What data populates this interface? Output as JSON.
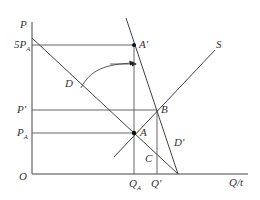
{
  "diagram": {
    "type": "supply-demand",
    "axes": {
      "y_label": "P",
      "x_label": "Q/t",
      "origin_label": "O"
    },
    "price_labels": {
      "five_pa": {
        "main": "5P",
        "sub": "A"
      },
      "p_prime": {
        "main": "P'"
      },
      "p_a": {
        "main": "P",
        "sub": "A"
      }
    },
    "quantity_labels": {
      "q_a": {
        "main": "Q",
        "sub": "A"
      },
      "q_prime": {
        "main": "Q'"
      }
    },
    "curves": {
      "demand": "D",
      "demand_shifted": "D'",
      "supply": "S"
    },
    "points": {
      "a": "A",
      "a_prime": "A'",
      "b": "B",
      "c": "C"
    },
    "colors": {
      "line": "#444444",
      "guide": "#555555",
      "text": "#333333",
      "background": "#ffffff"
    }
  }
}
